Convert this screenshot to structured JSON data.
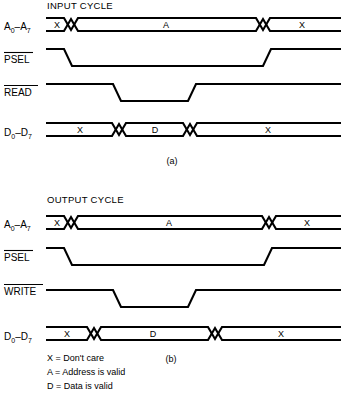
{
  "figure": {
    "kind": "timing-diagram",
    "background_color": "#ffffff",
    "line_color": "#000000"
  },
  "panels": [
    {
      "id": "panel-a",
      "title": "INPUT CYCLE",
      "caption": "(a)",
      "signals": [
        {
          "name": "A0-A7",
          "label_main": "A",
          "label_sub1": "0",
          "label_dash": "–",
          "label_main2": "A",
          "label_sub2": "7",
          "overline": false,
          "type": "bus",
          "segments": [
            {
              "value": "X",
              "meaning": "Don't care"
            },
            {
              "value": "A",
              "meaning": "Address is valid"
            },
            {
              "value": "X",
              "meaning": "Don't care"
            }
          ]
        },
        {
          "name": "PSEL",
          "label_main": "PSEL",
          "overline": true,
          "type": "level",
          "active_low": true,
          "states": [
            "high",
            "low",
            "high"
          ]
        },
        {
          "name": "READ",
          "label_main": "READ",
          "overline": true,
          "type": "level",
          "active_low": true,
          "states": [
            "high",
            "low",
            "high"
          ]
        },
        {
          "name": "D0-D7",
          "label_main": "D",
          "label_sub1": "0",
          "label_dash": "–",
          "label_main2": "D",
          "label_sub2": "7",
          "overline": false,
          "type": "bus",
          "segments": [
            {
              "value": "X",
              "meaning": "Don't care"
            },
            {
              "value": "D",
              "meaning": "Data is valid"
            },
            {
              "value": "X",
              "meaning": "Don't care"
            }
          ]
        }
      ]
    },
    {
      "id": "panel-b",
      "title": "OUTPUT CYCLE",
      "caption": "(b)",
      "signals": [
        {
          "name": "A0-A7",
          "label_main": "A",
          "label_sub1": "0",
          "label_dash": "–",
          "label_main2": "A",
          "label_sub2": "7",
          "overline": false,
          "type": "bus",
          "segments": [
            {
              "value": "X",
              "meaning": "Don't care"
            },
            {
              "value": "A",
              "meaning": "Address is valid"
            },
            {
              "value": "X",
              "meaning": "Don't care"
            }
          ]
        },
        {
          "name": "PSEL",
          "label_main": "PSEL",
          "overline": true,
          "type": "level",
          "active_low": true,
          "states": [
            "high",
            "low",
            "high"
          ]
        },
        {
          "name": "WRITE",
          "label_main": "WRITE",
          "overline": true,
          "type": "level",
          "active_low": true,
          "states": [
            "high",
            "low",
            "high"
          ]
        },
        {
          "name": "D0-D7",
          "label_main": "D",
          "label_sub1": "0",
          "label_dash": "–",
          "label_main2": "D",
          "label_sub2": "7",
          "overline": false,
          "type": "bus",
          "segments": [
            {
              "value": "X",
              "meaning": "Don't care"
            },
            {
              "value": "D",
              "meaning": "Data is valid"
            },
            {
              "value": "X",
              "meaning": "Don't care"
            }
          ]
        }
      ]
    }
  ],
  "legend": [
    {
      "symbol": "X",
      "equals": "=",
      "definition": "Don't care"
    },
    {
      "symbol": "A",
      "equals": "=",
      "definition": "Address is valid"
    },
    {
      "symbol": "D",
      "equals": "=",
      "definition": "Data is valid"
    }
  ],
  "legend_lines": [
    "X = Don't care",
    "A = Address is valid",
    "D = Data is valid"
  ]
}
